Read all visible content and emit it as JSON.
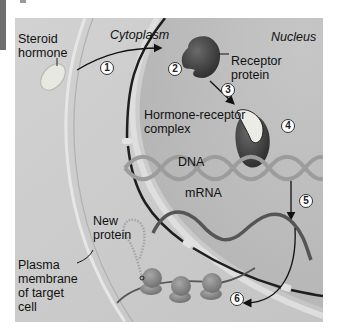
{
  "diagram": {
    "regions": {
      "cytoplasm": "Cytoplasm",
      "nucleus": "Nucleus"
    },
    "labels": {
      "steroid_hormone": "Steroid\nhormone",
      "receptor_protein": "Receptor\nprotein",
      "hormone_receptor_complex": "Hormone-receptor\ncomplex",
      "dna": "DNA",
      "mrna": "mRNA",
      "new_protein": "New\nprotein",
      "plasma_membrane": "Plasma\nmembrane\nof target\ncell"
    },
    "steps": [
      "1",
      "2",
      "3",
      "4",
      "5",
      "6"
    ],
    "colors": {
      "background": "#c9c9c9",
      "nucleus": "#bdbdbd",
      "receptor": "#3f3f3f",
      "hormone": "#e6e6e0",
      "dna": "#9a9a9a",
      "mrna": "#5a5a5a",
      "ribosome": "#8c8c8c"
    }
  }
}
